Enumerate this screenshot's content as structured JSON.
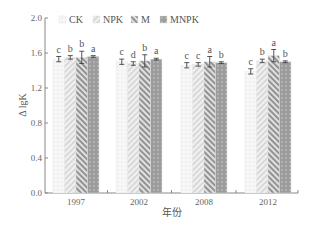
{
  "chart_data": {
    "type": "bar",
    "title": "",
    "xlabel": "年份",
    "ylabel": "Δ lgK",
    "ylim": [
      0.0,
      2.0
    ],
    "yticks": [
      "0.0",
      "0.4",
      "0.8",
      "1.2",
      "1.6",
      "2.0"
    ],
    "categories": [
      "1997",
      "2002",
      "2008",
      "2012"
    ],
    "legend": {
      "position": "top",
      "entries": [
        "CK",
        "NPK",
        "M",
        "MNPK"
      ]
    },
    "grid": false,
    "series": [
      {
        "name": "CK",
        "pattern": "dots-light",
        "values": [
          1.53,
          1.5,
          1.46,
          1.39
        ],
        "errors": [
          0.03,
          0.03,
          0.03,
          0.03
        ],
        "sig": [
          "c",
          "c",
          "c",
          "c"
        ]
      },
      {
        "name": "NPK",
        "pattern": "hatch-light",
        "values": [
          1.55,
          1.48,
          1.47,
          1.51
        ],
        "errors": [
          0.02,
          0.02,
          0.02,
          0.02
        ],
        "sig": [
          "b",
          "d",
          "c",
          "b"
        ]
      },
      {
        "name": "M",
        "pattern": "hatch-dark",
        "values": [
          1.55,
          1.51,
          1.5,
          1.57
        ],
        "errors": [
          0.07,
          0.07,
          0.06,
          0.07
        ],
        "sig": [
          "b",
          "b",
          "a",
          "a"
        ]
      },
      {
        "name": "MNPK",
        "pattern": "dots-dark",
        "values": [
          1.56,
          1.53,
          1.49,
          1.5
        ],
        "errors": [
          0.01,
          0.01,
          0.01,
          0.01
        ],
        "sig": [
          "a",
          "a",
          "b",
          "b"
        ]
      }
    ]
  },
  "colors": {
    "axis": "#888888",
    "CK": "#f2f2f2",
    "NPK": "#e6e6e6",
    "M": "#b5b5b5",
    "MNPK": "#9e9e9e"
  }
}
